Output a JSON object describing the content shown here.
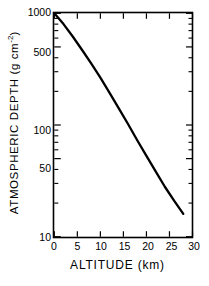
{
  "chart_data": {
    "type": "line",
    "title": "",
    "xlabel": "ALTITUDE (km)",
    "ylabel": "ATMOSPHERIC DEPTH (g cm",
    "ylabel_exponent": "-2",
    "ylabel_suffix": ")",
    "xlim": [
      0,
      30
    ],
    "ylim": [
      10,
      1000
    ],
    "yscale": "log",
    "xscale": "linear",
    "grid": false,
    "legend": null,
    "xticks": [
      0,
      5,
      10,
      15,
      20,
      25,
      30
    ],
    "xtick_labels": [
      "0",
      "5",
      "10",
      "15",
      "20",
      "25",
      "30"
    ],
    "yticks": [
      10,
      20,
      30,
      40,
      50,
      60,
      70,
      80,
      90,
      100,
      200,
      300,
      400,
      500,
      600,
      700,
      800,
      900,
      1000
    ],
    "ytick_labels_shown": [
      {
        "value": 1000,
        "label": "1000"
      },
      {
        "value": 500,
        "label": "500"
      },
      {
        "value": 100,
        "label": "100"
      },
      {
        "value": 50,
        "label": "50"
      },
      {
        "value": 10,
        "label": "10"
      }
    ],
    "series": [
      {
        "name": "atmospheric depth",
        "color": "#000000",
        "x": [
          0,
          2,
          4,
          6,
          8,
          10,
          12,
          14,
          16,
          18,
          20,
          22,
          24,
          26,
          28
        ],
        "values": [
          1000,
          800,
          620,
          472,
          356,
          265,
          194,
          141,
          102,
          73,
          53,
          38.5,
          28,
          21,
          16
        ]
      }
    ]
  }
}
